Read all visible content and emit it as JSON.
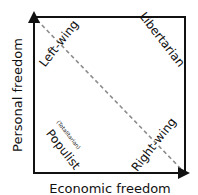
{
  "diagram": {
    "type": "Nolan chart",
    "axes": {
      "x_label": "Economic freedom",
      "y_label": "Personal freedom"
    },
    "regions": {
      "top_left": "Left-wing",
      "top_right": "Libertarian",
      "bottom_left": "Populist",
      "bottom_left_note": "(Totalitarian)",
      "bottom_right": "Right-wing"
    },
    "colors": {
      "frame": "#111111",
      "diagonal": "#8c8c8c"
    }
  }
}
